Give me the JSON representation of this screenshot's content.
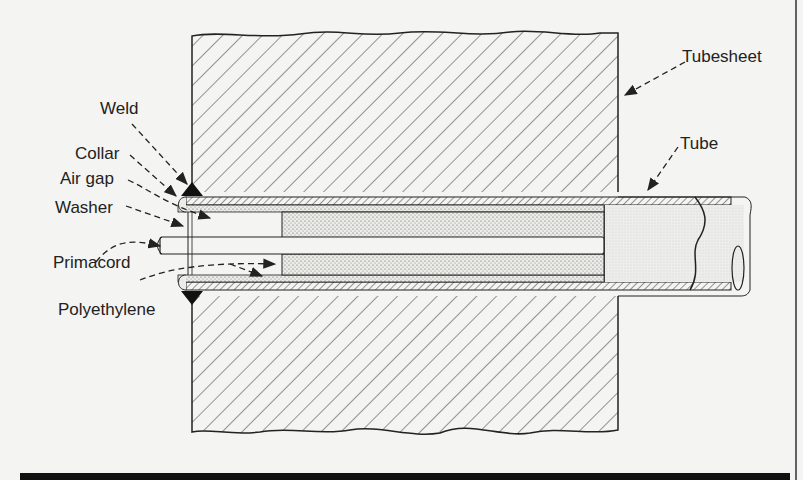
{
  "diagram": {
    "labels": {
      "tubesheet": "Tubesheet",
      "tube": "Tube",
      "weld": "Weld",
      "collar": "Collar",
      "air_gap": "Air gap",
      "washer": "Washer",
      "primacord": "Primacord",
      "polyethylene": "Polyethylene"
    }
  }
}
